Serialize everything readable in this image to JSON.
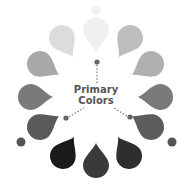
{
  "title": {
    "line1": "Primary",
    "line2": "Colors"
  },
  "center": [
    96,
    97
  ],
  "drops": [
    {
      "name": "drop-12",
      "cx": 96,
      "cy": 30,
      "angle": 0,
      "color": "#f0f0f0"
    },
    {
      "name": "drop-1",
      "cx": 130,
      "cy": 38,
      "angle": 30,
      "color": "#bdbdbd"
    },
    {
      "name": "drop-2",
      "cx": 151,
      "cy": 64,
      "angle": 60,
      "color": "#b0b0b0"
    },
    {
      "name": "drop-3",
      "cx": 160,
      "cy": 97,
      "angle": 90,
      "color": "#7a7a7a"
    },
    {
      "name": "drop-4",
      "cx": 151,
      "cy": 127,
      "angle": 120,
      "color": "#5c5c5c"
    },
    {
      "name": "drop-5",
      "cx": 129,
      "cy": 156,
      "angle": 150,
      "color": "#2e2e2e"
    },
    {
      "name": "drop-6",
      "cx": 96,
      "cy": 165,
      "angle": 180,
      "color": "#3a3a3a"
    },
    {
      "name": "drop-7",
      "cx": 63,
      "cy": 156,
      "angle": 210,
      "color": "#1a1a1a"
    },
    {
      "name": "drop-8",
      "cx": 40,
      "cy": 127,
      "angle": 240,
      "color": "#5a5a5a"
    },
    {
      "name": "drop-9",
      "cx": 31,
      "cy": 97,
      "angle": 270,
      "color": "#7a7a7a"
    },
    {
      "name": "drop-10",
      "cx": 40,
      "cy": 64,
      "angle": 300,
      "color": "#a8a8a8"
    },
    {
      "name": "drop-11",
      "cx": 62,
      "cy": 38,
      "angle": 330,
      "color": "#dcdcdc"
    }
  ],
  "outer_circles": [
    {
      "cx": 96,
      "cy": 10,
      "r": 5,
      "color": "#f2f2f2"
    },
    {
      "cx": 172,
      "cy": 142,
      "r": 4.5,
      "color": "#555555"
    },
    {
      "cx": 21,
      "cy": 142,
      "r": 4.5,
      "color": "#555555"
    }
  ],
  "primary_dots": [
    {
      "cx": 97,
      "cy": 62,
      "color": "#666666"
    },
    {
      "cx": 66,
      "cy": 118,
      "color": "#666666"
    },
    {
      "cx": 130,
      "cy": 117,
      "color": "#666666"
    }
  ],
  "connectors": [
    {
      "x1": 97,
      "y1": 65,
      "x2": 97,
      "y2": 84
    },
    {
      "x1": 69,
      "y1": 117,
      "x2": 84,
      "y2": 108
    },
    {
      "x1": 127,
      "y1": 116,
      "x2": 114,
      "y2": 108
    }
  ]
}
